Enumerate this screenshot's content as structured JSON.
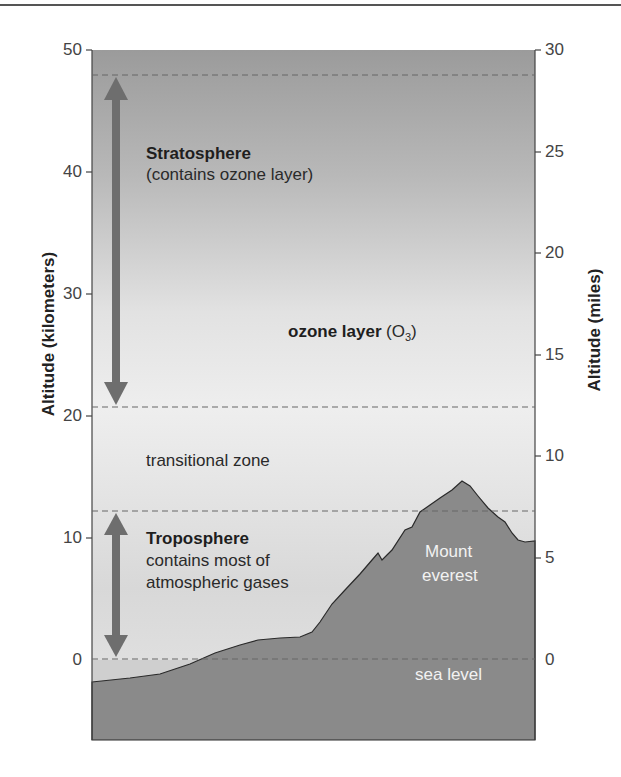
{
  "diagram": {
    "left_axis": {
      "title": "Altitude (kilometers)",
      "ticks": [
        "50",
        "40",
        "30",
        "20",
        "10",
        "0"
      ]
    },
    "right_axis": {
      "title": "Altitude (miles)",
      "ticks": [
        "30",
        "25",
        "20",
        "15",
        "10",
        "5",
        "0"
      ]
    },
    "labels": {
      "stratosphere_title": "Stratosphere",
      "stratosphere_desc": "(contains ozone layer)",
      "ozone_title": "ozone layer",
      "ozone_formula_open": "(O",
      "ozone_formula_sub": "3",
      "ozone_formula_close": ")",
      "transitional": "transitional zone",
      "troposphere_title": "Troposphere",
      "troposphere_desc_1": "contains most of",
      "troposphere_desc_2": "atmospheric gases",
      "mountain_1": "Mount",
      "mountain_2": "everest",
      "sea_level": "sea level"
    },
    "boundaries_km": {
      "stratosphere_top": 48,
      "stratosphere_bottom": 20.7,
      "troposphere_top": 12,
      "sea_level": 0
    },
    "colors": {
      "sky_top": "#9a9a9a",
      "sky_mid": "#ececec",
      "sky_low": "#d9d9d9",
      "ground": "#8a8a8a",
      "arrow": "#6e6e6e",
      "dash": "#666666",
      "axis": "#444444"
    }
  }
}
